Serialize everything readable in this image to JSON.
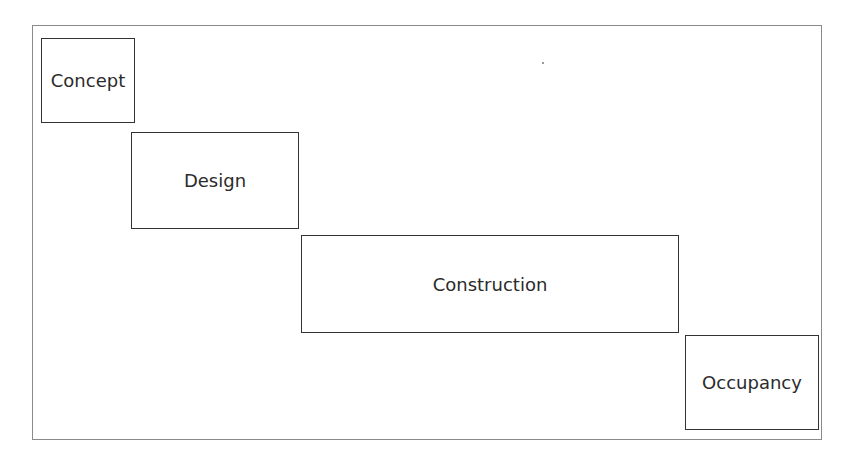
{
  "diagram": {
    "type": "staggered-phase-diagram",
    "phases": [
      {
        "label": "Concept",
        "order": 1
      },
      {
        "label": "Design",
        "order": 2
      },
      {
        "label": "Construction",
        "order": 3
      },
      {
        "label": "Occupancy",
        "order": 4
      }
    ],
    "colors": {
      "border": "#333333",
      "text": "#2b2b2b",
      "frame": "#8a8a8a",
      "background": "#ffffff"
    }
  }
}
